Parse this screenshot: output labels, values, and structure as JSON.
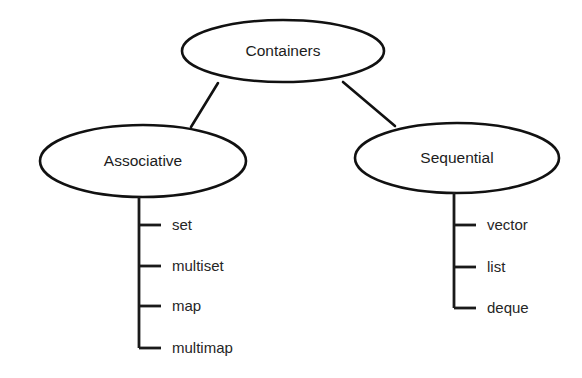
{
  "diagram": {
    "title": "Containers",
    "background_color": "#ffffff",
    "line_color": "#111111",
    "text_color": "#1c1c1c",
    "root": {
      "label": "Containers",
      "shape": "ellipse",
      "cx": 283,
      "cy": 51,
      "rx": 101,
      "ry": 31
    },
    "branches": [
      {
        "label": "Associative",
        "shape": "ellipse",
        "cx": 143,
        "cy": 161,
        "rx": 103,
        "ry": 36,
        "trunk_x": 139,
        "trunk_top": 197,
        "trunk_bottom": 348,
        "tick_end_x": 161,
        "label_x": 172,
        "connector": {
          "x1": 218,
          "y1": 83,
          "x2": 191,
          "y2": 127
        },
        "leaves": [
          {
            "label": "set",
            "y": 225
          },
          {
            "label": "multiset",
            "y": 266
          },
          {
            "label": "map",
            "y": 306
          },
          {
            "label": "multimap",
            "y": 348
          }
        ]
      },
      {
        "label": "Sequential",
        "shape": "ellipse",
        "cx": 457,
        "cy": 158,
        "rx": 102,
        "ry": 35,
        "trunk_x": 454,
        "trunk_top": 192,
        "trunk_bottom": 308,
        "tick_end_x": 476,
        "label_x": 487,
        "connector": {
          "x1": 343,
          "y1": 82,
          "x2": 395,
          "y2": 126
        },
        "leaves": [
          {
            "label": "vector",
            "y": 225
          },
          {
            "label": "list",
            "y": 267
          },
          {
            "label": "deque",
            "y": 308
          }
        ]
      }
    ]
  }
}
